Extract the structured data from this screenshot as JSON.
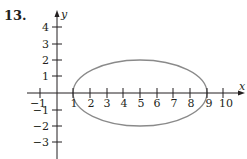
{
  "problem": {
    "number": "13."
  },
  "graph": {
    "x_axis_label": "x",
    "y_axis_label": "y",
    "x_ticks": [
      "−1",
      "1",
      "2",
      "3",
      "4",
      "5",
      "6",
      "7",
      "8",
      "9",
      "10"
    ],
    "y_ticks": [
      "4",
      "3",
      "2",
      "1",
      "−1",
      "−2",
      "−3"
    ],
    "ellipse": {
      "center_x": 5,
      "center_y": 0,
      "semi_major_x": 4,
      "semi_minor_y": 2,
      "stroke": "#8a8a8a"
    },
    "axis_color": "#231f20"
  }
}
